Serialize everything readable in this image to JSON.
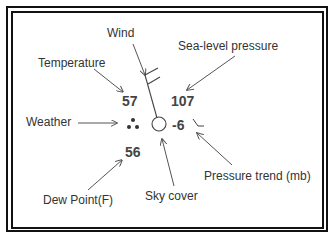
{
  "labels": {
    "wind": "Wind",
    "temperature": "Temperature",
    "sea_level_pressure": "Sea-level pressure",
    "weather": "Weather",
    "dew_point": "Dew Point(F)",
    "sky_cover": "Sky cover",
    "pressure_trend": "Pressure trend (mb)"
  },
  "values": {
    "temperature": "57",
    "sea_level_pressure": "107",
    "dew_point": "56",
    "pressure_change": "-6"
  },
  "symbols": {
    "weather": "three-dot-rain-icon",
    "sky_cover": "empty-circle-clear-sky-icon",
    "wind": "wind-barb-icon",
    "pressure_trend": "falling-then-steady-trend-icon"
  },
  "colors": {
    "line": "#555555",
    "text": "#333333",
    "border": "#111111"
  }
}
